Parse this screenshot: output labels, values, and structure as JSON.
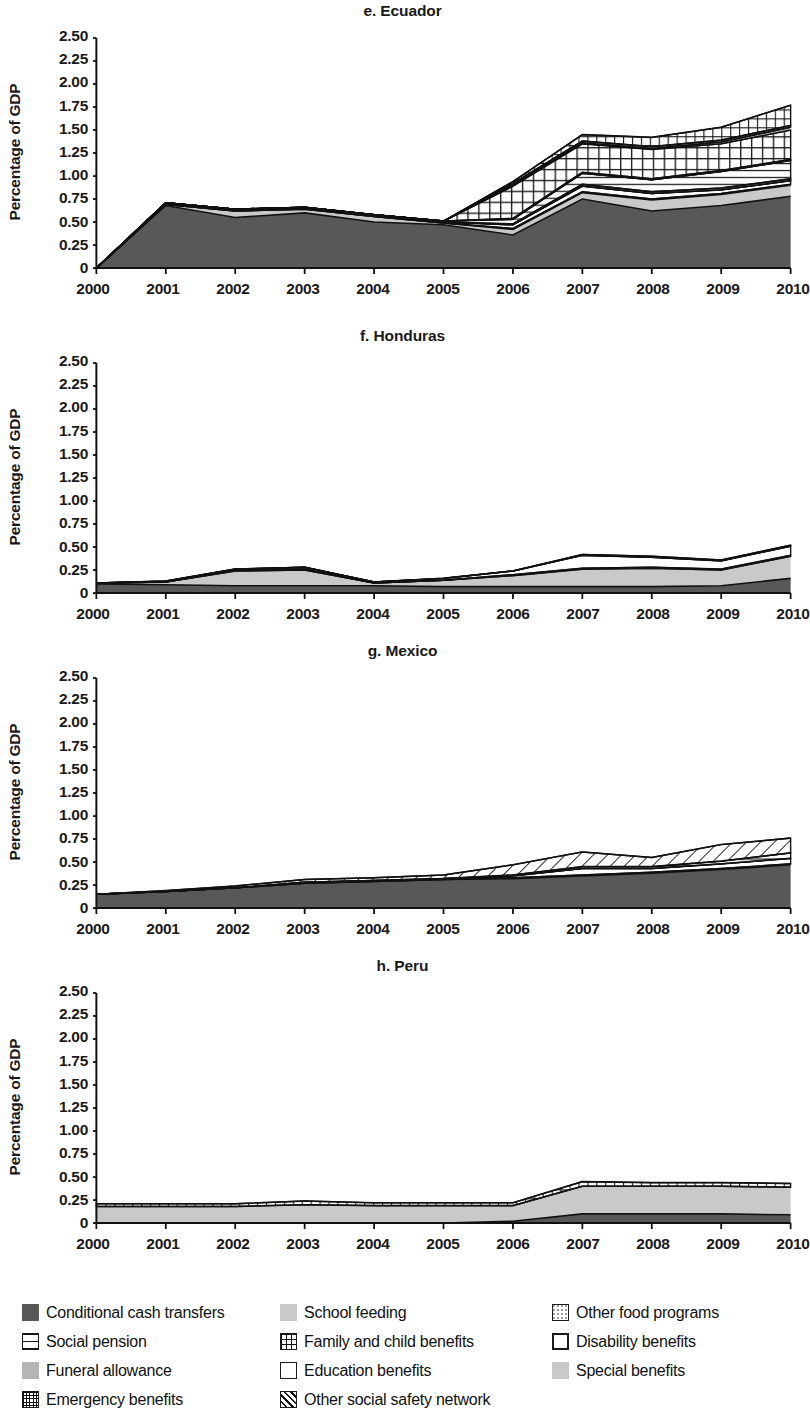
{
  "figure": {
    "y_axis_label": "Percentage of GDP",
    "y_ticks": [
      "2.50",
      "2.25",
      "2.00",
      "1.75",
      "1.50",
      "1.25",
      "1.00",
      "0.75",
      "0.50",
      "0.25",
      "0"
    ],
    "x_ticks": [
      "2000",
      "2001",
      "2002",
      "2003",
      "2004",
      "2005",
      "2006",
      "2007",
      "2008",
      "2009",
      "2010"
    ],
    "panels": [
      {
        "title": "e. Ecuador"
      },
      {
        "title": "f. Honduras"
      },
      {
        "title": "g. Mexico"
      },
      {
        "title": "h. Peru"
      }
    ]
  },
  "legend": {
    "rows": [
      [
        {
          "label": "Conditional cash transfers",
          "pattern": "solid-dark"
        },
        {
          "label": "School feeding",
          "pattern": "solid-light"
        },
        {
          "label": "Other food programs",
          "pattern": "dotted-light"
        }
      ],
      [
        {
          "label": "Social pension",
          "pattern": "horizontal-lines"
        },
        {
          "label": "Family and child benefits",
          "pattern": "grid"
        },
        {
          "label": "Disability benefits",
          "pattern": "empty-thick"
        }
      ],
      [
        {
          "label": "Funeral allowance",
          "pattern": "solid-mid-light"
        },
        {
          "label": "Education benefits",
          "pattern": "empty"
        },
        {
          "label": "Special benefits",
          "pattern": "solid-light2"
        }
      ],
      [
        {
          "label": "Emergency benefits",
          "pattern": "crosshatch"
        },
        {
          "label": "Other social safety network",
          "pattern": "diagonal"
        }
      ]
    ]
  },
  "colors": {
    "dark_gray": "#585858",
    "light_gray": "#c9c9c9",
    "mid_light_gray": "#b5b5b5",
    "outline": "#111111",
    "white": "#ffffff"
  },
  "chart_data": {
    "type": "area",
    "stacked": true,
    "xlabel": "",
    "ylabel": "Percentage of GDP",
    "ylim": [
      0,
      2.5
    ],
    "y_tick_values": [
      0,
      0.25,
      0.5,
      0.75,
      1.0,
      1.25,
      1.5,
      1.75,
      2.0,
      2.25,
      2.5
    ],
    "grid": false,
    "legend_position": "bottom",
    "x": [
      2000,
      2001,
      2002,
      2003,
      2004,
      2005,
      2006,
      2007,
      2008,
      2009,
      2010
    ],
    "panels": [
      {
        "name": "e. Ecuador",
        "series": [
          {
            "name": "Conditional cash transfers",
            "pattern": "solid-dark",
            "values": [
              0.0,
              0.68,
              0.55,
              0.6,
              0.5,
              0.47,
              0.36,
              0.75,
              0.62,
              0.68,
              0.78
            ]
          },
          {
            "name": "School feeding",
            "pattern": "solid-light",
            "values": [
              0.0,
              0.01,
              0.07,
              0.04,
              0.06,
              0.02,
              0.06,
              0.07,
              0.12,
              0.12,
              0.12
            ]
          },
          {
            "name": "Funeral allowance",
            "pattern": "solid-mid-light",
            "values": [
              0.0,
              0.0,
              0.0,
              0.0,
              0.0,
              0.0,
              0.01,
              0.01,
              0.01,
              0.01,
              0.01
            ]
          },
          {
            "name": "Education benefits",
            "pattern": "empty",
            "values": [
              0.0,
              0.01,
              0.01,
              0.01,
              0.01,
              0.01,
              0.04,
              0.06,
              0.06,
              0.04,
              0.04
            ]
          },
          {
            "name": "Other food programs",
            "pattern": "dotted-light",
            "values": [
              0.0,
              0.0,
              0.0,
              0.0,
              0.0,
              0.0,
              0.01,
              0.02,
              0.02,
              0.02,
              0.02
            ]
          },
          {
            "name": "Social pension",
            "pattern": "horizontal-lines",
            "values": [
              0.0,
              0.01,
              0.01,
              0.01,
              0.01,
              0.01,
              0.05,
              0.12,
              0.13,
              0.18,
              0.2
            ]
          },
          {
            "name": "Disability benefits",
            "pattern": "empty-thick",
            "values": [
              0.0,
              0.0,
              0.0,
              0.0,
              0.0,
              0.0,
              0.01,
              0.01,
              0.01,
              0.01,
              0.01
            ]
          },
          {
            "name": "Emergency benefits",
            "pattern": "crosshatch",
            "values": [
              0.0,
              0.0,
              0.0,
              0.0,
              0.0,
              0.0,
              0.35,
              0.31,
              0.32,
              0.29,
              0.32
            ]
          },
          {
            "name": "Special benefits",
            "pattern": "solid-light2",
            "values": [
              0.0,
              0.0,
              0.0,
              0.0,
              0.0,
              0.0,
              0.01,
              0.01,
              0.01,
              0.02,
              0.03
            ]
          },
          {
            "name": "Other social safety network",
            "pattern": "diagonal",
            "values": [
              0.0,
              0.0,
              0.0,
              0.0,
              0.0,
              0.0,
              0.02,
              0.02,
              0.02,
              0.02,
              0.02
            ]
          },
          {
            "name": "Family and child benefits",
            "pattern": "grid",
            "values": [
              0.0,
              0.0,
              0.0,
              0.0,
              0.0,
              0.0,
              0.02,
              0.07,
              0.1,
              0.14,
              0.22
            ]
          }
        ],
        "totals": [
          0.0,
          0.71,
          0.64,
          0.66,
          0.58,
          0.51,
          0.94,
          1.45,
          1.42,
          1.53,
          1.77
        ]
      },
      {
        "name": "f. Honduras",
        "series": [
          {
            "name": "Conditional cash transfers",
            "pattern": "solid-dark",
            "values": [
              0.1,
              0.09,
              0.08,
              0.08,
              0.08,
              0.07,
              0.07,
              0.07,
              0.07,
              0.08,
              0.16
            ]
          },
          {
            "name": "School feeding",
            "pattern": "solid-light",
            "values": [
              0.01,
              0.03,
              0.16,
              0.17,
              0.03,
              0.07,
              0.12,
              0.19,
              0.2,
              0.17,
              0.24
            ]
          },
          {
            "name": "Other food programs",
            "pattern": "dotted-light",
            "values": [
              0.0,
              0.0,
              0.01,
              0.01,
              0.0,
              0.0,
              0.01,
              0.01,
              0.01,
              0.01,
              0.01
            ]
          },
          {
            "name": "Education benefits",
            "pattern": "empty",
            "values": [
              0.0,
              0.01,
              0.01,
              0.02,
              0.01,
              0.02,
              0.04,
              0.14,
              0.11,
              0.09,
              0.1
            ]
          },
          {
            "name": "Other social safety network",
            "pattern": "diagonal",
            "values": [
              0.0,
              0.0,
              0.0,
              0.0,
              0.0,
              0.0,
              0.0,
              0.01,
              0.01,
              0.01,
              0.01
            ]
          }
        ],
        "totals": [
          0.11,
          0.13,
          0.26,
          0.28,
          0.12,
          0.16,
          0.24,
          0.42,
          0.4,
          0.36,
          0.52
        ]
      },
      {
        "name": "g. Mexico",
        "series": [
          {
            "name": "Conditional cash transfers",
            "pattern": "solid-dark",
            "values": [
              0.15,
              0.18,
              0.22,
              0.27,
              0.29,
              0.31,
              0.32,
              0.35,
              0.38,
              0.42,
              0.47
            ]
          },
          {
            "name": "School feeding",
            "pattern": "solid-light",
            "values": [
              0.0,
              0.0,
              0.0,
              0.0,
              0.0,
              0.0,
              0.01,
              0.01,
              0.01,
              0.01,
              0.01
            ]
          },
          {
            "name": "Education benefits",
            "pattern": "empty",
            "values": [
              0.0,
              0.0,
              0.0,
              0.01,
              0.01,
              0.01,
              0.02,
              0.07,
              0.04,
              0.05,
              0.06
            ]
          },
          {
            "name": "Social pension",
            "pattern": "horizontal-lines",
            "values": [
              0.0,
              0.0,
              0.0,
              0.0,
              0.0,
              0.0,
              0.01,
              0.02,
              0.02,
              0.03,
              0.06
            ]
          },
          {
            "name": "Other social safety network",
            "pattern": "diagonal",
            "values": [
              0.0,
              0.01,
              0.02,
              0.03,
              0.03,
              0.04,
              0.11,
              0.16,
              0.1,
              0.18,
              0.16
            ]
          }
        ],
        "totals": [
          0.15,
          0.19,
          0.24,
          0.31,
          0.33,
          0.36,
          0.47,
          0.61,
          0.55,
          0.69,
          0.76
        ]
      },
      {
        "name": "h. Peru",
        "series": [
          {
            "name": "Conditional cash transfers",
            "pattern": "solid-dark",
            "values": [
              0.0,
              0.0,
              0.0,
              0.0,
              0.0,
              0.0,
              0.02,
              0.1,
              0.1,
              0.1,
              0.09
            ]
          },
          {
            "name": "School feeding",
            "pattern": "solid-light",
            "values": [
              0.18,
              0.18,
              0.18,
              0.2,
              0.19,
              0.19,
              0.17,
              0.3,
              0.3,
              0.3,
              0.3
            ]
          },
          {
            "name": "Family and child benefits",
            "pattern": "grid",
            "values": [
              0.03,
              0.03,
              0.03,
              0.04,
              0.03,
              0.03,
              0.03,
              0.05,
              0.04,
              0.04,
              0.04
            ]
          }
        ],
        "totals": [
          0.21,
          0.21,
          0.21,
          0.24,
          0.22,
          0.22,
          0.22,
          0.45,
          0.44,
          0.44,
          0.43
        ]
      }
    ]
  }
}
